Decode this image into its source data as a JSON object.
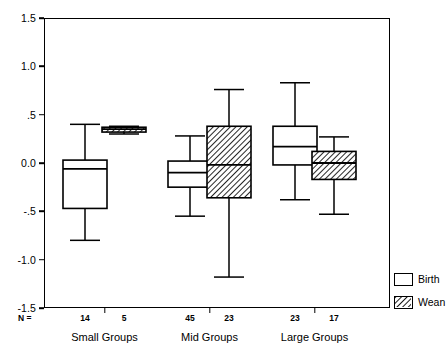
{
  "chart_data": {
    "type": "box",
    "title": "",
    "xlabel": "",
    "ylabel": "",
    "ylim": [
      -1.5,
      1.5
    ],
    "grid": false,
    "legend_position": "right-bottom",
    "y_ticks": [
      {
        "value": 1.5,
        "label": "1.5"
      },
      {
        "value": 1.0,
        "label": "1.0"
      },
      {
        "value": 0.5,
        "label": ".5"
      },
      {
        "value": 0.0,
        "label": "0.0"
      },
      {
        "value": -0.5,
        "label": "-.5"
      },
      {
        "value": -1.0,
        "label": "-1.0"
      },
      {
        "value": -1.5,
        "label": "-1.5"
      }
    ],
    "n_prefix": "N =",
    "categories": [
      "Small Groups",
      "Mid Groups",
      "Large Groups"
    ],
    "legend": [
      {
        "name": "Birth",
        "fill": "white"
      },
      {
        "name": "Wean",
        "fill": "hatched"
      }
    ],
    "boxes": [
      {
        "group": "Small Groups",
        "series": "Birth",
        "n": "14",
        "whisker_low": -0.8,
        "q1": -0.47,
        "median": -0.06,
        "q3": 0.03,
        "whisker_high": 0.4
      },
      {
        "group": "Small Groups",
        "series": "Wean",
        "n": "5",
        "whisker_low": 0.3,
        "q1": 0.32,
        "median": 0.35,
        "q3": 0.37,
        "whisker_high": 0.38
      },
      {
        "group": "Mid Groups",
        "series": "Birth",
        "n": "45",
        "whisker_low": -0.55,
        "q1": -0.25,
        "median": -0.1,
        "q3": 0.02,
        "whisker_high": 0.28
      },
      {
        "group": "Mid Groups",
        "series": "Wean",
        "n": "23",
        "whisker_low": -1.18,
        "q1": -0.36,
        "median": -0.02,
        "q3": 0.38,
        "whisker_high": 0.76
      },
      {
        "group": "Large Groups",
        "series": "Birth",
        "n": "23",
        "whisker_low": -0.38,
        "q1": -0.02,
        "median": 0.17,
        "q3": 0.38,
        "whisker_high": 0.83
      },
      {
        "group": "Large Groups",
        "series": "Wean",
        "n": "17",
        "whisker_low": -0.53,
        "q1": -0.17,
        "median": 0.0,
        "q3": 0.12,
        "whisker_high": 0.27
      }
    ]
  },
  "colors": {
    "axis": "#000000",
    "box_stroke": "#000000",
    "birth_fill": "#ffffff",
    "wean_hatch": "#000000",
    "background": "#ffffff"
  }
}
